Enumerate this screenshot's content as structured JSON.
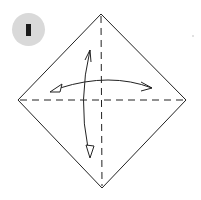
{
  "step": {
    "number": "1",
    "badge_color": "#d9d9d9"
  },
  "diagram": {
    "line_color": "#222222",
    "vertices": {
      "top": [
        101,
        14
      ],
      "right": [
        186,
        100
      ],
      "bottom": [
        102,
        188
      ],
      "left": [
        18,
        100
      ]
    },
    "folds": [
      "vertical-valley-fold",
      "horizontal-valley-fold"
    ],
    "arrows": [
      "fold-unfold-horizontal-arrow",
      "fold-unfold-vertical-arrow"
    ]
  }
}
